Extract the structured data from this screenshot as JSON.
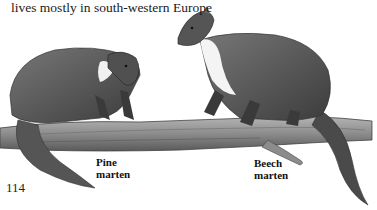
{
  "caption": "lives mostly in south-western Europe",
  "labels": {
    "pine": {
      "line1": "Pine",
      "line2": "marten"
    },
    "beech": {
      "line1": "Beech",
      "line2": "marten"
    }
  },
  "page_number": "114",
  "colors": {
    "ink": "#1a1a1a",
    "fur_dark": "#4a4a4a",
    "fur_mid": "#6e6e6e",
    "branch": "#8a8a8a",
    "throat": "#f2f2f2"
  }
}
